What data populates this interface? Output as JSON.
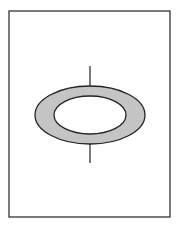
{
  "figure": {
    "frame": {
      "x": 9,
      "y": 11,
      "width": 161,
      "height": 206,
      "stroke": "#222222"
    },
    "ring": {
      "cx": 90,
      "cy": 115,
      "outer_rx": 55,
      "outer_ry": 29,
      "inner_rx": 36,
      "inner_ry": 19,
      "fill": "#c4c4c4",
      "stroke": "#222222"
    },
    "axis_line": {
      "x": 90,
      "top_y1": 66,
      "top_y2": 86,
      "bottom_y1": 144,
      "bottom_y2": 163,
      "stroke": "#222222"
    }
  }
}
